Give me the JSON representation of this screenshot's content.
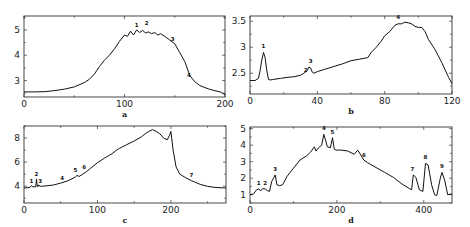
{
  "figure": {
    "layout": "2x2 grid",
    "panels": [
      "a",
      "b",
      "c",
      "d"
    ]
  },
  "chart_data": [
    {
      "type": "line",
      "panel": "a",
      "title": "",
      "xlabel": "a",
      "ylabel": "",
      "xlim": [
        0,
        200
      ],
      "ylim": [
        2.35,
        5.55
      ],
      "xticks": [
        0,
        100,
        200
      ],
      "yticks": [
        3,
        4,
        5
      ],
      "grid": false,
      "frame": {
        "left": 24,
        "right": 225,
        "top": 16,
        "bottom": 97
      },
      "x": [
        0,
        10,
        20,
        30,
        40,
        50,
        60,
        65,
        70,
        75,
        80,
        85,
        90,
        95,
        100,
        103,
        106,
        109,
        112,
        115,
        118,
        121,
        124,
        127,
        130,
        133,
        136,
        140,
        145,
        150,
        155,
        160,
        165,
        170,
        175,
        180,
        185,
        190,
        195,
        200
      ],
      "y": [
        2.55,
        2.55,
        2.56,
        2.6,
        2.66,
        2.75,
        2.92,
        3.05,
        3.25,
        3.55,
        3.8,
        4.0,
        4.25,
        4.55,
        4.8,
        4.75,
        4.95,
        4.8,
        5.0,
        4.9,
        4.98,
        4.88,
        4.92,
        4.85,
        4.9,
        4.8,
        4.85,
        4.75,
        4.6,
        4.45,
        4.1,
        3.75,
        3.2,
        2.95,
        2.8,
        2.72,
        2.65,
        2.6,
        2.55,
        2.45
      ],
      "annotations": [
        {
          "label": "1",
          "x": 112,
          "y": 5.12
        },
        {
          "label": "2",
          "x": 122,
          "y": 5.18
        },
        {
          "label": "3",
          "x": 148,
          "y": 4.55
        },
        {
          "label": "4",
          "x": 164,
          "y": 3.15
        }
      ]
    },
    {
      "type": "line",
      "panel": "b",
      "title": "",
      "xlabel": "b",
      "ylabel": "",
      "xlim": [
        0,
        120
      ],
      "ylim": [
        2.1,
        3.6
      ],
      "xticks": [
        0,
        40,
        80,
        120
      ],
      "yticks": [
        2.5,
        3,
        3.5
      ],
      "ytick_labels": [
        "2.5",
        "3",
        "3.5"
      ],
      "grid": false,
      "frame": {
        "left": 250,
        "right": 452,
        "top": 16,
        "bottom": 94
      },
      "x": [
        0,
        3,
        5,
        6,
        7,
        8,
        9,
        10,
        11,
        12,
        14,
        18,
        22,
        26,
        30,
        32,
        34,
        35,
        36,
        37,
        38,
        40,
        45,
        50,
        55,
        60,
        65,
        70,
        72,
        75,
        78,
        80,
        83,
        86,
        88,
        90,
        92,
        94,
        96,
        98,
        100,
        102,
        104,
        106,
        110,
        114,
        118,
        120
      ],
      "y": [
        2.36,
        2.36,
        2.4,
        2.55,
        2.75,
        2.9,
        2.8,
        2.55,
        2.38,
        2.37,
        2.38,
        2.4,
        2.42,
        2.43,
        2.46,
        2.5,
        2.55,
        2.62,
        2.6,
        2.52,
        2.5,
        2.53,
        2.58,
        2.63,
        2.68,
        2.74,
        2.77,
        2.8,
        2.9,
        3.0,
        3.12,
        3.22,
        3.3,
        3.42,
        3.45,
        3.45,
        3.48,
        3.47,
        3.45,
        3.4,
        3.38,
        3.38,
        3.3,
        3.15,
        2.95,
        2.7,
        2.42,
        2.3
      ],
      "annotations": [
        {
          "label": "1",
          "x": 8,
          "y": 2.98
        },
        {
          "label": "2",
          "x": 33,
          "y": 2.52
        },
        {
          "label": "3",
          "x": 36,
          "y": 2.7
        },
        {
          "label": "4",
          "x": 88,
          "y": 3.54
        }
      ]
    },
    {
      "type": "line",
      "panel": "c",
      "title": "",
      "xlabel": "c",
      "ylabel": "",
      "xlim": [
        0,
        275
      ],
      "ylim": [
        2.6,
        9.0
      ],
      "xticks": [
        0,
        100,
        200
      ],
      "yticks": [
        4,
        6,
        8
      ],
      "grid": false,
      "frame": {
        "left": 24,
        "right": 226,
        "top": 126,
        "bottom": 203
      },
      "x": [
        0,
        8,
        10,
        12,
        16,
        17,
        18,
        19,
        20,
        22,
        25,
        30,
        40,
        50,
        60,
        70,
        72,
        75,
        80,
        85,
        90,
        100,
        110,
        120,
        125,
        130,
        140,
        150,
        160,
        165,
        170,
        175,
        180,
        185,
        190,
        195,
        198,
        200,
        203,
        207,
        212,
        220,
        228,
        232,
        240,
        250,
        260,
        275
      ],
      "y": [
        3.85,
        3.9,
        4.05,
        3.95,
        3.95,
        4.6,
        4.0,
        3.95,
        4.1,
        4.0,
        4.0,
        4.02,
        4.1,
        4.25,
        4.45,
        4.75,
        4.9,
        4.8,
        5.0,
        5.2,
        5.45,
        5.95,
        6.35,
        6.7,
        6.95,
        7.15,
        7.45,
        7.75,
        8.1,
        8.35,
        8.55,
        8.7,
        8.55,
        8.35,
        8.0,
        7.85,
        8.2,
        8.55,
        7.0,
        5.6,
        5.0,
        4.7,
        4.45,
        4.35,
        4.15,
        3.98,
        3.9,
        3.85
      ],
      "annotations": [
        {
          "label": "1",
          "x": 10,
          "y": 4.3
        },
        {
          "label": "2",
          "x": 17,
          "y": 4.85
        },
        {
          "label": "3",
          "x": 22,
          "y": 4.25
        },
        {
          "label": "4",
          "x": 52,
          "y": 4.5
        },
        {
          "label": "5",
          "x": 70,
          "y": 5.15
        },
        {
          "label": "6",
          "x": 82,
          "y": 5.4
        },
        {
          "label": "7",
          "x": 228,
          "y": 4.8
        }
      ]
    },
    {
      "type": "line",
      "panel": "d",
      "title": "",
      "xlabel": "d",
      "ylabel": "",
      "xlim": [
        0,
        465
      ],
      "ylim": [
        0.5,
        5.1
      ],
      "xticks": [
        0,
        200,
        400
      ],
      "yticks": [
        1,
        2,
        3,
        4,
        5
      ],
      "grid": false,
      "frame": {
        "left": 250,
        "right": 452,
        "top": 127,
        "bottom": 203
      },
      "x": [
        0,
        8,
        15,
        20,
        25,
        30,
        35,
        40,
        45,
        50,
        55,
        58,
        62,
        68,
        75,
        85,
        100,
        115,
        130,
        140,
        148,
        152,
        158,
        165,
        170,
        174,
        178,
        185,
        190,
        194,
        198,
        210,
        225,
        240,
        248,
        255,
        262,
        270,
        290,
        310,
        330,
        350,
        365,
        372,
        376,
        382,
        390,
        398,
        404,
        410,
        418,
        425,
        430,
        438,
        442,
        448,
        455,
        465
      ],
      "y": [
        1.0,
        1.05,
        1.3,
        1.35,
        1.25,
        1.38,
        1.35,
        1.25,
        1.2,
        1.8,
        2.05,
        2.2,
        1.6,
        1.55,
        1.6,
        2.1,
        2.6,
        3.1,
        3.35,
        3.6,
        3.9,
        3.65,
        3.85,
        4.0,
        4.65,
        4.3,
        3.9,
        3.85,
        4.45,
        3.75,
        3.7,
        3.7,
        3.65,
        3.45,
        3.7,
        3.4,
        3.1,
        2.95,
        2.65,
        2.35,
        2.05,
        1.65,
        1.4,
        1.3,
        2.2,
        2.05,
        1.3,
        1.2,
        2.9,
        2.8,
        1.6,
        1.0,
        0.95,
        2.0,
        2.35,
        1.9,
        1.0,
        1.05
      ],
      "annotations": [
        {
          "label": "1",
          "x": 20,
          "y": 1.6
        },
        {
          "label": "2",
          "x": 35,
          "y": 1.6
        },
        {
          "label": "3",
          "x": 58,
          "y": 2.45
        },
        {
          "label": "4",
          "x": 170,
          "y": 4.9
        },
        {
          "label": "5",
          "x": 190,
          "y": 4.7
        },
        {
          "label": "6",
          "x": 262,
          "y": 3.3
        },
        {
          "label": "7",
          "x": 374,
          "y": 2.45
        },
        {
          "label": "8",
          "x": 404,
          "y": 3.15
        },
        {
          "label": "9",
          "x": 442,
          "y": 2.6
        }
      ]
    }
  ]
}
